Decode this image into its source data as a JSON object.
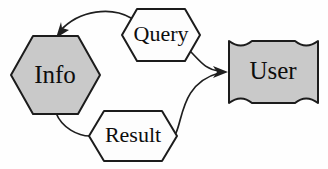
{
  "diagram": {
    "type": "data-flow-diagram",
    "background_color": "#fefefe",
    "stroke_color": "#1f1f1f",
    "fill_entity_color": "#c9c9c9",
    "fill_flow_color": "#fdfdfd",
    "nodes": [
      {
        "id": "info",
        "label": "Info",
        "shape": "hexagon",
        "fill": "#c9c9c9",
        "cx": 55,
        "cy": 75
      },
      {
        "id": "query",
        "label": "Query",
        "shape": "hexagon",
        "fill": "#fdfdfd",
        "cx": 161,
        "cy": 35
      },
      {
        "id": "result",
        "label": "Result",
        "shape": "hexagon",
        "fill": "#fdfdfd",
        "cx": 133,
        "cy": 136
      },
      {
        "id": "user",
        "label": "User",
        "shape": "concave-corner-rectangle",
        "fill": "#c9c9c9",
        "cx": 273,
        "cy": 72
      }
    ],
    "edges": [
      {
        "id": "query-to-info",
        "from": "query",
        "to": "info",
        "arrow": true
      },
      {
        "id": "query-to-user",
        "from": "query",
        "to": "user",
        "arrow": true
      },
      {
        "id": "info-to-result",
        "from": "info",
        "to": "result",
        "arrow": false
      },
      {
        "id": "result-to-user",
        "from": "result",
        "to": "user",
        "arrow": true
      }
    ]
  }
}
